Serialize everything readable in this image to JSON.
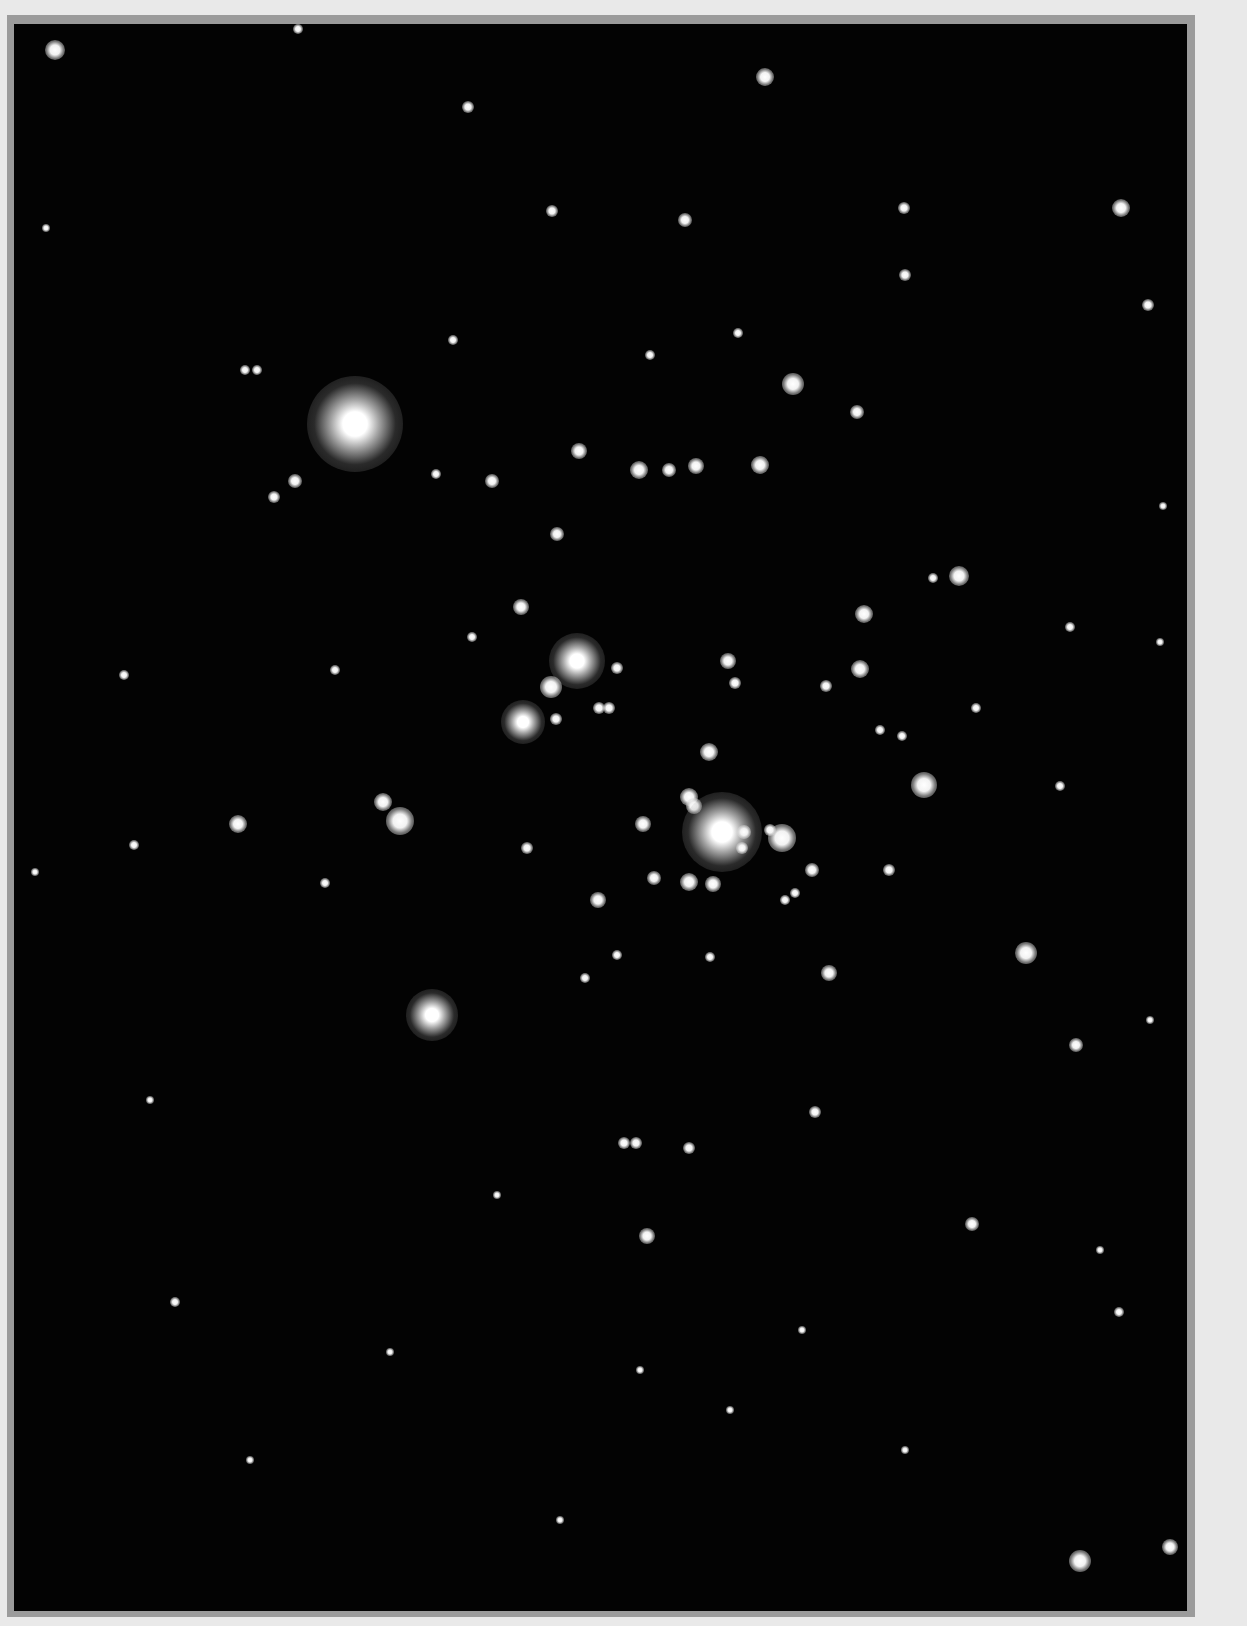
{
  "image": {
    "subject": "open star cluster star field",
    "colors": {
      "margin": "#e9e9e9",
      "frame": "#9b9b9b",
      "sky": "#030303",
      "star": "#ffffff"
    }
  },
  "stars": [
    {
      "x": 55,
      "y": 50,
      "r": 10
    },
    {
      "x": 298,
      "y": 29,
      "r": 5
    },
    {
      "x": 765,
      "y": 77,
      "r": 9
    },
    {
      "x": 468,
      "y": 107,
      "r": 6
    },
    {
      "x": 1121,
      "y": 208,
      "r": 9
    },
    {
      "x": 685,
      "y": 220,
      "r": 7
    },
    {
      "x": 552,
      "y": 211,
      "r": 6
    },
    {
      "x": 905,
      "y": 275,
      "r": 6
    },
    {
      "x": 904,
      "y": 208,
      "r": 6
    },
    {
      "x": 1148,
      "y": 305,
      "r": 6
    },
    {
      "x": 355,
      "y": 424,
      "r": 48,
      "halo": true
    },
    {
      "x": 793,
      "y": 384,
      "r": 11
    },
    {
      "x": 857,
      "y": 412,
      "r": 7
    },
    {
      "x": 579,
      "y": 451,
      "r": 8
    },
    {
      "x": 639,
      "y": 470,
      "r": 9
    },
    {
      "x": 669,
      "y": 470,
      "r": 7
    },
    {
      "x": 696,
      "y": 466,
      "r": 8
    },
    {
      "x": 760,
      "y": 465,
      "r": 9
    },
    {
      "x": 492,
      "y": 481,
      "r": 7
    },
    {
      "x": 295,
      "y": 481,
      "r": 7
    },
    {
      "x": 274,
      "y": 497,
      "r": 6
    },
    {
      "x": 557,
      "y": 534,
      "r": 7
    },
    {
      "x": 959,
      "y": 576,
      "r": 10
    },
    {
      "x": 864,
      "y": 614,
      "r": 9
    },
    {
      "x": 521,
      "y": 607,
      "r": 8
    },
    {
      "x": 577,
      "y": 661,
      "r": 28,
      "halo": true
    },
    {
      "x": 551,
      "y": 687,
      "r": 11
    },
    {
      "x": 523,
      "y": 722,
      "r": 22,
      "halo": true
    },
    {
      "x": 860,
      "y": 669,
      "r": 9
    },
    {
      "x": 728,
      "y": 661,
      "r": 8
    },
    {
      "x": 709,
      "y": 752,
      "r": 9
    },
    {
      "x": 689,
      "y": 797,
      "r": 9
    },
    {
      "x": 694,
      "y": 806,
      "r": 8
    },
    {
      "x": 722,
      "y": 832,
      "r": 40,
      "halo": true
    },
    {
      "x": 782,
      "y": 838,
      "r": 14
    },
    {
      "x": 744,
      "y": 832,
      "r": 7
    },
    {
      "x": 812,
      "y": 870,
      "r": 7
    },
    {
      "x": 924,
      "y": 785,
      "r": 13
    },
    {
      "x": 643,
      "y": 824,
      "r": 8
    },
    {
      "x": 689,
      "y": 882,
      "r": 9
    },
    {
      "x": 713,
      "y": 884,
      "r": 8
    },
    {
      "x": 654,
      "y": 878,
      "r": 7
    },
    {
      "x": 598,
      "y": 900,
      "r": 8
    },
    {
      "x": 383,
      "y": 802,
      "r": 9
    },
    {
      "x": 400,
      "y": 821,
      "r": 14
    },
    {
      "x": 238,
      "y": 824,
      "r": 9
    },
    {
      "x": 1026,
      "y": 953,
      "r": 11
    },
    {
      "x": 829,
      "y": 973,
      "r": 8
    },
    {
      "x": 432,
      "y": 1015,
      "r": 26,
      "halo": true
    },
    {
      "x": 1076,
      "y": 1045,
      "r": 7
    },
    {
      "x": 815,
      "y": 1112,
      "r": 6
    },
    {
      "x": 624,
      "y": 1143,
      "r": 6
    },
    {
      "x": 636,
      "y": 1143,
      "r": 6
    },
    {
      "x": 689,
      "y": 1148,
      "r": 6
    },
    {
      "x": 647,
      "y": 1236,
      "r": 8
    },
    {
      "x": 972,
      "y": 1224,
      "r": 7
    },
    {
      "x": 1119,
      "y": 1312,
      "r": 5
    },
    {
      "x": 1080,
      "y": 1561,
      "r": 11
    },
    {
      "x": 1170,
      "y": 1547,
      "r": 8
    },
    {
      "x": 175,
      "y": 1302,
      "r": 5
    },
    {
      "x": 134,
      "y": 845,
      "r": 5
    },
    {
      "x": 124,
      "y": 675,
      "r": 5
    },
    {
      "x": 35,
      "y": 872,
      "r": 4
    },
    {
      "x": 46,
      "y": 228,
      "r": 4
    },
    {
      "x": 245,
      "y": 370,
      "r": 5
    },
    {
      "x": 257,
      "y": 370,
      "r": 5
    },
    {
      "x": 1163,
      "y": 506,
      "r": 4
    },
    {
      "x": 1160,
      "y": 642,
      "r": 4
    },
    {
      "x": 976,
      "y": 708,
      "r": 5
    },
    {
      "x": 1060,
      "y": 786,
      "r": 5
    },
    {
      "x": 497,
      "y": 1195,
      "r": 4
    },
    {
      "x": 390,
      "y": 1352,
      "r": 4
    },
    {
      "x": 640,
      "y": 1370,
      "r": 4
    },
    {
      "x": 905,
      "y": 1450,
      "r": 4
    },
    {
      "x": 250,
      "y": 1460,
      "r": 4
    },
    {
      "x": 1100,
      "y": 1250,
      "r": 4
    },
    {
      "x": 1150,
      "y": 1020,
      "r": 4
    },
    {
      "x": 150,
      "y": 1100,
      "r": 4
    },
    {
      "x": 730,
      "y": 1410,
      "r": 4
    },
    {
      "x": 560,
      "y": 1520,
      "r": 4
    },
    {
      "x": 802,
      "y": 1330,
      "r": 4
    },
    {
      "x": 453,
      "y": 340,
      "r": 5
    },
    {
      "x": 650,
      "y": 355,
      "r": 5
    },
    {
      "x": 738,
      "y": 333,
      "r": 5
    },
    {
      "x": 436,
      "y": 474,
      "r": 5
    },
    {
      "x": 617,
      "y": 668,
      "r": 6
    },
    {
      "x": 599,
      "y": 708,
      "r": 6
    },
    {
      "x": 609,
      "y": 708,
      "r": 6
    },
    {
      "x": 735,
      "y": 683,
      "r": 6
    },
    {
      "x": 826,
      "y": 686,
      "r": 6
    },
    {
      "x": 889,
      "y": 870,
      "r": 6
    },
    {
      "x": 527,
      "y": 848,
      "r": 6
    },
    {
      "x": 933,
      "y": 578,
      "r": 5
    },
    {
      "x": 1070,
      "y": 627,
      "r": 5
    },
    {
      "x": 335,
      "y": 670,
      "r": 5
    },
    {
      "x": 325,
      "y": 883,
      "r": 5
    },
    {
      "x": 585,
      "y": 978,
      "r": 5
    },
    {
      "x": 617,
      "y": 955,
      "r": 5
    },
    {
      "x": 785,
      "y": 900,
      "r": 5
    },
    {
      "x": 795,
      "y": 893,
      "r": 5
    },
    {
      "x": 710,
      "y": 957,
      "r": 5
    },
    {
      "x": 556,
      "y": 719,
      "r": 6
    },
    {
      "x": 472,
      "y": 637,
      "r": 5
    },
    {
      "x": 880,
      "y": 730,
      "r": 5
    },
    {
      "x": 902,
      "y": 736,
      "r": 5
    },
    {
      "x": 742,
      "y": 848,
      "r": 6
    },
    {
      "x": 770,
      "y": 830,
      "r": 6
    }
  ]
}
